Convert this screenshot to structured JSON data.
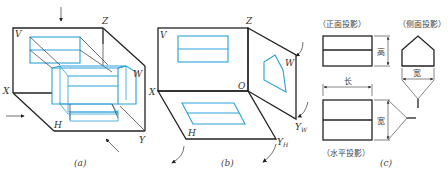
{
  "colors": {
    "object_line": "#2aa0d8",
    "frame_line": "#222222",
    "text": "#333333"
  },
  "panel_a": {
    "caption": "(a)",
    "axis_labels": {
      "v": "V",
      "z": "Z",
      "x": "X",
      "w": "W",
      "h": "H",
      "y": "Y"
    }
  },
  "panel_b": {
    "caption": "(b)",
    "axis_labels": {
      "v": "V",
      "z": "Z",
      "x": "X",
      "o": "O",
      "w": "W",
      "h": "H",
      "yw": "Y",
      "yw_sub": "W",
      "yh": "Y",
      "yh_sub": "H"
    }
  },
  "panel_c": {
    "caption": "(c)",
    "views": {
      "front": "（正面投影）",
      "side": "（侧面投影）",
      "top": "（水平投影）"
    },
    "dimensions": {
      "height": "高",
      "length": "长",
      "width_side": "宽",
      "width_top": "宽"
    }
  }
}
